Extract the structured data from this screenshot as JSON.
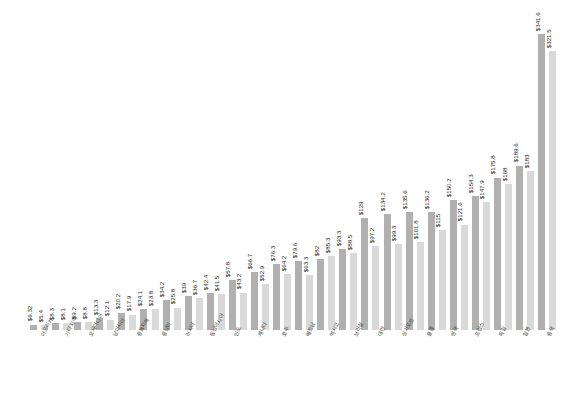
{
  "chart_data": {
    "type": "bar",
    "title": "",
    "subtitle": "",
    "xlabel": "",
    "ylabel": "",
    "grid": false,
    "legend": "none",
    "axis_visible": false,
    "value_prefix": "$",
    "ylim": [
      0,
      360
    ],
    "orientation": "vertical",
    "sort": "ascending",
    "pair_count": 22,
    "bar_count": 44,
    "colors": {
      "series_a": "#b0b0b0",
      "series_b": "#d9d9d9",
      "label_text": "#2b2b2b",
      "category_text": "#3a3a3a",
      "background": "#ffffff"
    },
    "categories": [
      "아프리카",
      "기타 지역",
      "오세아니아",
      "남아시아",
      "중동지역",
      "중남미",
      "러시아",
      "동남아시아",
      "인도",
      "캐나다",
      "호주",
      "베트남",
      "멕시코",
      "브라질",
      "대만",
      "싱가포르",
      "홍콩",
      "영국",
      "프랑스",
      "독일",
      "일본",
      "중국"
    ],
    "series": [
      {
        "name": "계열 A",
        "values": [
          5.4,
          8.1,
          8.8,
          12.1,
          17.9,
          24.1,
          34.2,
          39,
          42.4,
          57.8,
          66.7,
          76.3,
          79.6,
          82,
          93.3,
          129,
          134.2,
          135.6,
          136.2,
          150.2,
          154.3,
          175.8
        ]
      },
      {
        "name": "계열 B",
        "values": [
          6.32,
          8.3,
          9.2,
          13.3,
          20.2,
          23.8,
          25.8,
          36.7,
          41.5,
          43.2,
          52.9,
          64.2,
          63.3,
          85.3,
          88.5,
          97.2,
          99.3,
          101.8,
          115,
          121.6,
          147.9,
          168
        ]
      }
    ],
    "bars": [
      {
        "label": "$6.32",
        "value": 6.32,
        "shade": "dark"
      },
      {
        "label": "$5.4",
        "value": 5.4,
        "shade": "light"
      },
      {
        "label": "$8.3",
        "value": 8.3,
        "shade": "dark"
      },
      {
        "label": "$8.1",
        "value": 8.1,
        "shade": "light"
      },
      {
        "label": "$9.2",
        "value": 9.2,
        "shade": "dark"
      },
      {
        "label": "$8.8",
        "value": 8.8,
        "shade": "light"
      },
      {
        "label": "$13.3",
        "value": 13.3,
        "shade": "dark"
      },
      {
        "label": "$12.1",
        "value": 12.1,
        "shade": "light"
      },
      {
        "label": "$20.2",
        "value": 20.2,
        "shade": "dark"
      },
      {
        "label": "$17.9",
        "value": 17.9,
        "shade": "light"
      },
      {
        "label": "$24.1",
        "value": 24.1,
        "shade": "dark"
      },
      {
        "label": "$23.8",
        "value": 23.8,
        "shade": "light"
      },
      {
        "label": "$34.2",
        "value": 34.2,
        "shade": "dark"
      },
      {
        "label": "$25.8",
        "value": 25.8,
        "shade": "light"
      },
      {
        "label": "$39",
        "value": 39,
        "shade": "dark"
      },
      {
        "label": "$36.7",
        "value": 36.7,
        "shade": "light"
      },
      {
        "label": "$42.4",
        "value": 42.4,
        "shade": "dark"
      },
      {
        "label": "$41.5",
        "value": 41.5,
        "shade": "light"
      },
      {
        "label": "$57.8",
        "value": 57.8,
        "shade": "dark"
      },
      {
        "label": "$43.2",
        "value": 43.2,
        "shade": "light"
      },
      {
        "label": "$66.7",
        "value": 66.7,
        "shade": "dark"
      },
      {
        "label": "$52.9",
        "value": 52.9,
        "shade": "light"
      },
      {
        "label": "$76.3",
        "value": 76.3,
        "shade": "dark"
      },
      {
        "label": "$64.2",
        "value": 64.2,
        "shade": "light"
      },
      {
        "label": "$79.6",
        "value": 79.6,
        "shade": "dark"
      },
      {
        "label": "$63.3",
        "value": 63.3,
        "shade": "light"
      },
      {
        "label": "$82",
        "value": 82,
        "shade": "dark"
      },
      {
        "label": "$85.3",
        "value": 85.3,
        "shade": "light"
      },
      {
        "label": "$93.3",
        "value": 93.3,
        "shade": "dark"
      },
      {
        "label": "$88.5",
        "value": 88.5,
        "shade": "light"
      },
      {
        "label": "$129",
        "value": 129,
        "shade": "dark"
      },
      {
        "label": "$97.2",
        "value": 97.2,
        "shade": "light"
      },
      {
        "label": "$134.2",
        "value": 134.2,
        "shade": "dark"
      },
      {
        "label": "$99.3",
        "value": 99.3,
        "shade": "light"
      },
      {
        "label": "$135.6",
        "value": 135.6,
        "shade": "dark"
      },
      {
        "label": "$101.8",
        "value": 101.8,
        "shade": "light"
      },
      {
        "label": "$136.2",
        "value": 136.2,
        "shade": "dark"
      },
      {
        "label": "$115",
        "value": 115,
        "shade": "light"
      },
      {
        "label": "$150.2",
        "value": 150.2,
        "shade": "dark"
      },
      {
        "label": "$121.6",
        "value": 121.6,
        "shade": "light"
      },
      {
        "label": "$154.3",
        "value": 154.3,
        "shade": "dark"
      },
      {
        "label": "$147.9",
        "value": 147.9,
        "shade": "light"
      },
      {
        "label": "$175.8",
        "value": 175.8,
        "shade": "dark"
      },
      {
        "label": "$168",
        "value": 168,
        "shade": "light"
      },
      {
        "label": "$189.6",
        "value": 189.6,
        "shade": "dark"
      },
      {
        "label": "$183",
        "value": 183,
        "shade": "light"
      },
      {
        "label": "$341.6",
        "value": 341.6,
        "shade": "dark"
      },
      {
        "label": "$321.5",
        "value": 321.5,
        "shade": "light"
      }
    ]
  }
}
